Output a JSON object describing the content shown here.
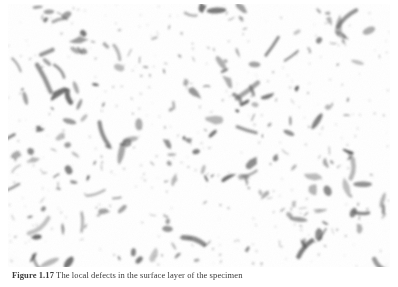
{
  "figure": {
    "kind": "micrograph",
    "caption_label": "Figure 1.17",
    "caption_text": "The local defects in the surface layer of the specimen",
    "caption_full": "Figure 1.17 The local defects in the surface layer of the specimen",
    "background_color": "#ffffff",
    "particle_color": "#6a6a6a",
    "particle_dark_color": "#3f3f3f",
    "border_color": "#e6e6e6",
    "plate": {
      "x": 8,
      "y": 4,
      "width": 382,
      "height": 263
    },
    "particle_count": 300
  },
  "chart_data": {
    "type": "scatter",
    "title": "",
    "xlabel": "",
    "ylabel": "",
    "note": "Particle field positions are procedurally generated from a fixed seed; see figure.particle_count."
  }
}
